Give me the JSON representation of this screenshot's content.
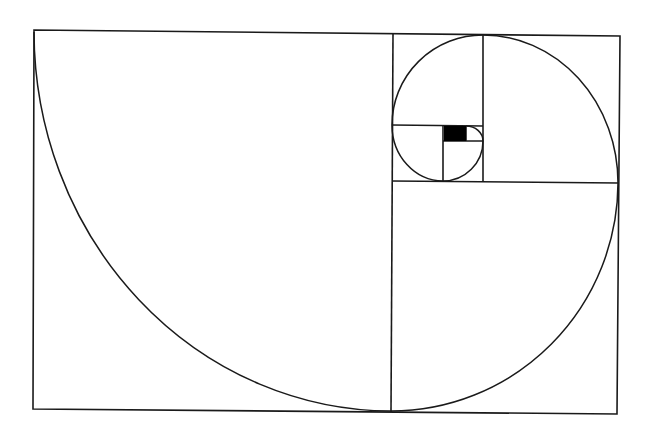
{
  "diagram": {
    "type": "golden-rectangle-spiral",
    "colors": {
      "line": "#1a1a1a",
      "fill_square": "#000000",
      "background": "#ffffff"
    },
    "outer_rectangle": {
      "tl": [
        34,
        30
      ],
      "tr": [
        620,
        36
      ],
      "br": [
        617,
        414
      ],
      "bl": [
        33,
        409
      ]
    },
    "squares": [
      {
        "name": "square-1",
        "x1": 34,
        "y1": 30,
        "x2": 392,
        "y2": 411
      },
      {
        "name": "square-2",
        "x1": 392,
        "y1": 182,
        "x2": 618,
        "y2": 412
      },
      {
        "name": "square-3",
        "x1": 483,
        "y1": 35,
        "x2": 619,
        "y2": 182
      },
      {
        "name": "square-4",
        "x1": 393,
        "y1": 34,
        "x2": 483,
        "y2": 125
      },
      {
        "name": "square-5",
        "x1": 392,
        "y1": 125,
        "x2": 443,
        "y2": 181
      },
      {
        "name": "square-6",
        "x1": 443,
        "y1": 141,
        "x2": 483,
        "y2": 181
      },
      {
        "name": "square-7",
        "x1": 466,
        "y1": 126,
        "x2": 483,
        "y2": 141
      },
      {
        "name": "filled-square",
        "x1": 444,
        "y1": 126,
        "x2": 466,
        "y2": 141
      }
    ],
    "spiral_arcs": 7
  }
}
